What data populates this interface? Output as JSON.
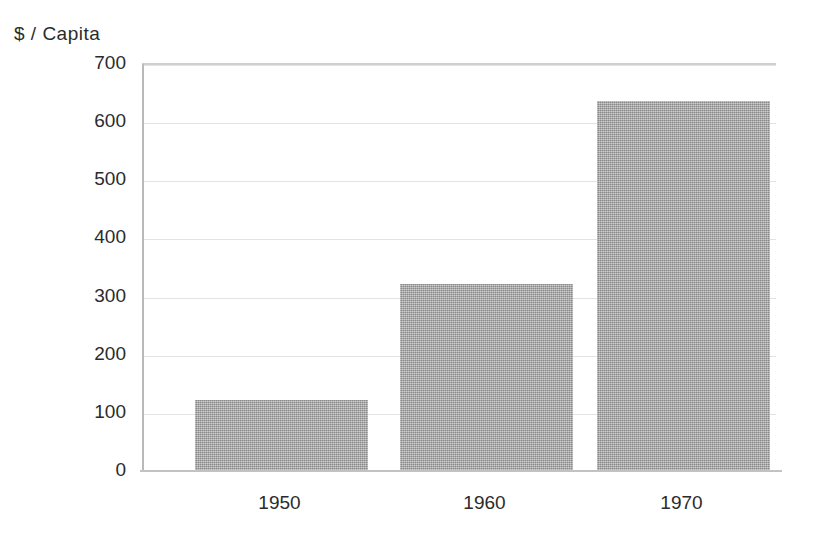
{
  "chart_data": {
    "type": "bar",
    "title": "",
    "subtitle": "",
    "ylabel": "$ / Capita",
    "xlabel": "",
    "categories": [
      "1950",
      "1960",
      "1970"
    ],
    "values": [
      120,
      320,
      635
    ],
    "series": [
      {
        "name": "$ / Capita",
        "values": [
          120,
          320,
          635
        ]
      }
    ],
    "ylim": [
      0,
      700
    ],
    "yticks": [
      "0",
      "100",
      "200",
      "300",
      "400",
      "500",
      "600",
      "700"
    ],
    "ytick_values": [
      0,
      100,
      200,
      300,
      400,
      500,
      600,
      700
    ],
    "grid": true,
    "legend": false,
    "legend_position": "none",
    "annotations": [],
    "bar_color": "#9a9a9a",
    "grid_color": "#e3e3e3",
    "axis_color": "#c2c2c2",
    "background_color": "#ffffff",
    "text_color": "#2b2b2b"
  }
}
